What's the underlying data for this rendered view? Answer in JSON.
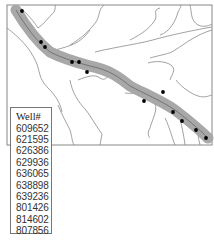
{
  "map": {
    "frame": {
      "x": 7,
      "y": 5,
      "width": 205,
      "height": 140
    },
    "colors": {
      "frame": "#888888",
      "contour": "#8a8a8a",
      "buffer": "#a8a8a8",
      "river": "#555555",
      "well": "#000000"
    },
    "wells": [
      {
        "x": 22,
        "y": 11
      },
      {
        "x": 41,
        "y": 42
      },
      {
        "x": 45,
        "y": 47
      },
      {
        "x": 72,
        "y": 62
      },
      {
        "x": 79,
        "y": 62
      },
      {
        "x": 87,
        "y": 72
      },
      {
        "x": 163,
        "y": 92
      },
      {
        "x": 144,
        "y": 101
      },
      {
        "x": 173,
        "y": 112
      },
      {
        "x": 182,
        "y": 121
      },
      {
        "x": 196,
        "y": 130
      },
      {
        "x": 206,
        "y": 138
      }
    ]
  },
  "legend": {
    "title": "Well#",
    "wells": [
      "609652",
      "621595",
      "626386",
      "629936",
      "636065",
      "638898",
      "639236",
      "801426",
      "814602",
      "807856"
    ]
  }
}
